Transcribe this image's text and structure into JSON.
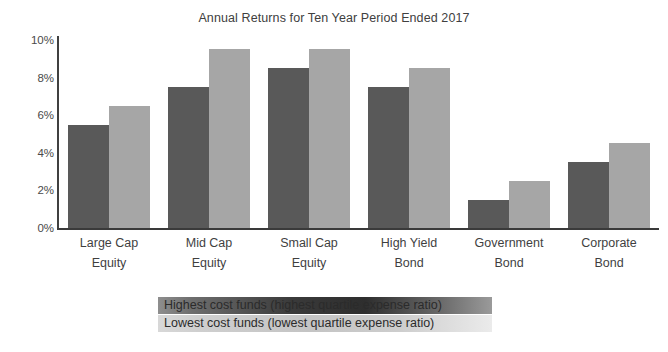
{
  "chart_data": {
    "type": "bar",
    "title": "Annual Returns for Ten Year Period Ended 2017",
    "xlabel": "",
    "ylabel": "",
    "ylim": [
      0,
      10
    ],
    "ytick_labels": [
      "10%",
      "8%",
      "6%",
      "4%",
      "2%",
      "0%"
    ],
    "ytick_values": [
      10,
      8,
      6,
      4,
      2,
      0
    ],
    "grid": false,
    "legend_position": "bottom",
    "categories": [
      "Large Cap Equity",
      "Mid Cap Equity",
      "Small Cap Equity",
      "High Yield Bond",
      "Government Bond",
      "Corporate Bond"
    ],
    "category_lines": [
      [
        "Large Cap",
        "Equity"
      ],
      [
        "Mid Cap",
        "Equity"
      ],
      [
        "Small Cap",
        "Equity"
      ],
      [
        "High Yield",
        "Bond"
      ],
      [
        "Government",
        "Bond"
      ],
      [
        "Corporate",
        "Bond"
      ]
    ],
    "series": [
      {
        "name": "Highest cost funds (highest quartile expense ratio)",
        "color": "#595959",
        "values": [
          5.5,
          7.5,
          8.5,
          7.5,
          1.5,
          3.5
        ]
      },
      {
        "name": "Lowest cost funds (lowest quartile expense ratio)",
        "color": "#a6a6a6",
        "values": [
          6.5,
          9.5,
          9.5,
          8.5,
          2.5,
          4.5
        ]
      }
    ]
  },
  "legend": {
    "rows": [
      {
        "label": "Highest cost funds (highest quartile expense ratio)",
        "style": "highest"
      },
      {
        "label": "Lowest cost funds (lowest quartile expense ratio)",
        "style": "lowest"
      }
    ]
  },
  "colors": {
    "dark_bar": "#595959",
    "light_bar": "#a6a6a6",
    "axis": "#3a3a3a",
    "text": "#3f3f3f",
    "background": "#ffffff"
  }
}
